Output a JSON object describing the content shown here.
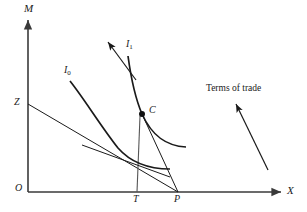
{
  "figure": {
    "background_color": "#ffffff",
    "line_color": "#1a1a1a",
    "axis_color": "#3a3a3a"
  },
  "axes": {
    "vertical": {
      "label": "M",
      "name": "m-axis",
      "x": 28,
      "y_top": 20,
      "y_bottom": 192,
      "label_x": 24,
      "label_y": 4
    },
    "horizontal": {
      "label": "X",
      "name": "x-axis",
      "y": 192,
      "x_left": 28,
      "x_right": 281,
      "label_x": 287,
      "label_y": 186
    },
    "origin": {
      "label": "O",
      "x": 17,
      "y": 184
    }
  },
  "points": [
    {
      "id": "Z",
      "label": "Z",
      "label_x": 15,
      "label_y": 98,
      "x": 28,
      "y": 104,
      "dot": false
    },
    {
      "id": "C",
      "label": "C",
      "label_x": 148,
      "label_y": 106,
      "x": 142,
      "y": 114,
      "dot": true
    },
    {
      "id": "T",
      "label": "T",
      "label_x": 133,
      "label_y": 194,
      "x": 136,
      "y": 192,
      "dot": false
    },
    {
      "id": "P",
      "label": "P",
      "label_x": 174,
      "label_y": 194,
      "x": 178,
      "y": 192,
      "dot": false
    }
  ],
  "curves": [
    {
      "id": "I0",
      "label": "I",
      "sublabel": "0",
      "label_x": 64,
      "label_y": 66,
      "name": "indifference-curve-i0",
      "path": "M 70,81 C 85,100 100,125 118,148 C 132,164 150,169 170,169"
    },
    {
      "id": "I1",
      "label": "I",
      "sublabel": "1",
      "label_x": 126,
      "label_y": 40,
      "name": "indifference-curve-i1",
      "path": "M 128,56 C 131,78 136,100 142,114 C 152,136 166,146 186,147"
    }
  ],
  "lines": [
    {
      "id": "budget-line",
      "name": "budget-line-zp",
      "from_x": 28,
      "from_y": 104,
      "to_x": 178,
      "to_y": 192
    },
    {
      "id": "trade-line",
      "name": "trade-line-cp",
      "from_x": 142,
      "from_y": 114,
      "to_x": 178,
      "to_y": 192
    },
    {
      "id": "drop-line",
      "name": "drop-line-ct",
      "from_x": 140,
      "from_y": 116,
      "to_x": 137,
      "to_y": 192
    },
    {
      "id": "tangent-line",
      "name": "tangent-line-i0",
      "from_x": 82,
      "from_y": 145,
      "to_x": 170,
      "to_y": 177
    }
  ],
  "arrows": [
    {
      "id": "i1-direction",
      "name": "i1-direction-arrow",
      "from_x": 136,
      "from_y": 80,
      "to_x": 108,
      "to_y": 42
    },
    {
      "id": "terms-of-trade",
      "name": "terms-of-trade-arrow",
      "from_x": 268,
      "from_y": 170,
      "to_x": 236,
      "to_y": 104
    }
  ],
  "annotations": [
    {
      "id": "terms-of-trade-label",
      "text": "Terms of trade",
      "x": 207,
      "y": 84
    }
  ],
  "chart_data": {
    "type": "line",
    "xlabel": "X",
    "ylabel": "M",
    "grid": false,
    "legend": "inline-curve-labels",
    "annotations": [
      "Terms of trade"
    ],
    "series": [
      {
        "name": "I0",
        "role": "indifference curve (lower utility)"
      },
      {
        "name": "I1",
        "role": "indifference curve (higher utility)"
      },
      {
        "name": "ZP",
        "role": "terms-of-trade / budget line from Z to P"
      },
      {
        "name": "CP",
        "role": "trade vector from consumption point C to production point P"
      }
    ],
    "marked_points": [
      "O",
      "Z",
      "C",
      "T",
      "P"
    ]
  }
}
